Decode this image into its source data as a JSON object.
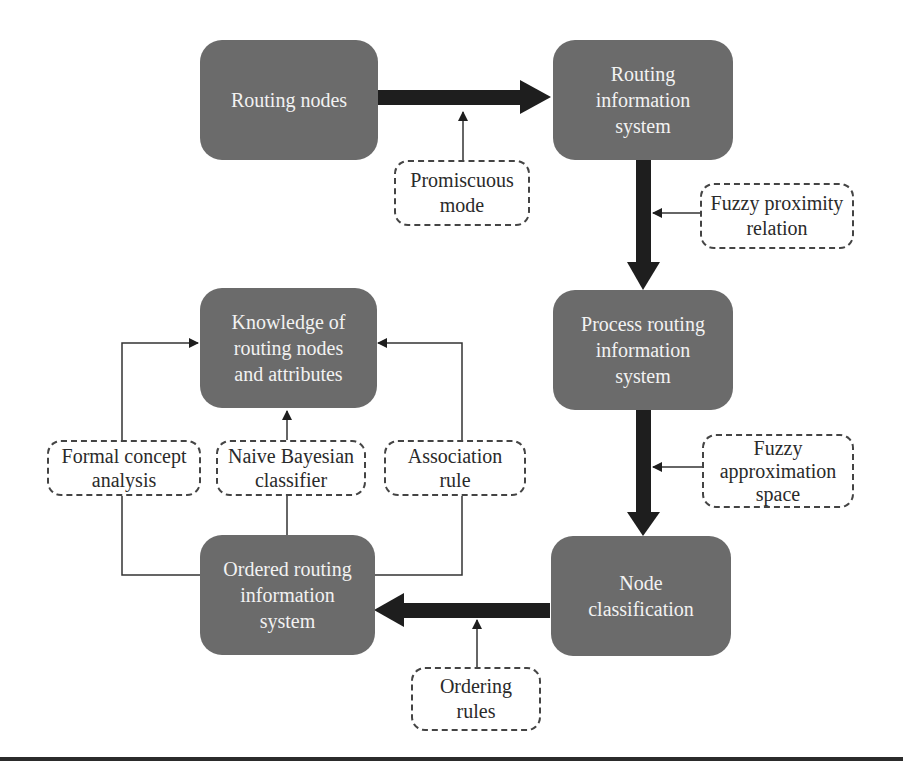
{
  "diagram": {
    "nodes": [
      {
        "id": "routing-nodes",
        "label": "Routing nodes"
      },
      {
        "id": "routing-information-system",
        "label": "Routing\ninformation\nsystem"
      },
      {
        "id": "process-routing-information-system",
        "label": "Process routing\ninformation\nsystem"
      },
      {
        "id": "node-classification",
        "label": "Node\nclassification"
      },
      {
        "id": "ordered-routing-information-system",
        "label": "Ordered routing\ninformation\nsystem"
      },
      {
        "id": "knowledge",
        "label": "Knowledge of\nrouting nodes\nand attributes"
      }
    ],
    "annotations": [
      {
        "id": "promiscuous-mode",
        "label": "Promiscuous\nmode"
      },
      {
        "id": "fuzzy-proximity-relation",
        "label": "Fuzzy proximity\nrelation"
      },
      {
        "id": "fuzzy-approximation-space",
        "label": "Fuzzy\napproximation\nspace"
      },
      {
        "id": "ordering-rules",
        "label": "Ordering\nrules"
      },
      {
        "id": "formal-concept-analysis",
        "label": "Formal concept\nanalysis"
      },
      {
        "id": "naive-bayesian-classifier",
        "label": "Naive Bayesian\nclassifier"
      },
      {
        "id": "association-rule",
        "label": "Association\nrule"
      }
    ],
    "edges": [
      {
        "from": "routing-nodes",
        "to": "routing-information-system",
        "style": "thick",
        "via": "promiscuous-mode"
      },
      {
        "from": "routing-information-system",
        "to": "process-routing-information-system",
        "style": "thick",
        "via": "fuzzy-proximity-relation"
      },
      {
        "from": "process-routing-information-system",
        "to": "node-classification",
        "style": "thick",
        "via": "fuzzy-approximation-space"
      },
      {
        "from": "node-classification",
        "to": "ordered-routing-information-system",
        "style": "thick",
        "via": "ordering-rules"
      },
      {
        "from": "ordered-routing-information-system",
        "to": "knowledge",
        "style": "thin",
        "via": "formal-concept-analysis"
      },
      {
        "from": "ordered-routing-information-system",
        "to": "knowledge",
        "style": "thin",
        "via": "naive-bayesian-classifier"
      },
      {
        "from": "ordered-routing-information-system",
        "to": "knowledge",
        "style": "thin",
        "via": "association-rule"
      }
    ],
    "colors": {
      "node_fill": "#6b6b6b",
      "node_text": "#f2f2f2",
      "arrow": "#1e1e1e",
      "label_border": "#444444"
    }
  }
}
